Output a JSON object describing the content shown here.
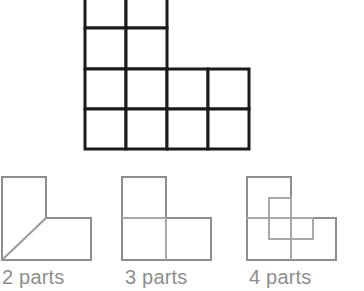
{
  "page": {
    "background_color": "#ffffff"
  },
  "main_shape": {
    "name": "l-shaped-polyomino-grid",
    "description": "Thick black outlined L-shaped polyomino made of unit squares",
    "stroke_color": "#1a1a1a",
    "stroke_width": 3,
    "cell_size": 41,
    "origin_x": 85,
    "origin_y": -12,
    "cells": [
      {
        "col": 0,
        "row": 0
      },
      {
        "col": 1,
        "row": 0
      },
      {
        "col": 0,
        "row": 1
      },
      {
        "col": 1,
        "row": 1
      },
      {
        "col": 0,
        "row": 2
      },
      {
        "col": 1,
        "row": 2
      },
      {
        "col": 2,
        "row": 2
      },
      {
        "col": 3,
        "row": 2
      },
      {
        "col": 0,
        "row": 3
      },
      {
        "col": 1,
        "row": 3
      },
      {
        "col": 2,
        "row": 3
      },
      {
        "col": 3,
        "row": 3
      }
    ],
    "cell_count": 12,
    "columns": 4,
    "rows": 4
  },
  "figures": [
    {
      "id": "fig-2-parts",
      "label": "2 parts",
      "parts": 2,
      "stroke_color": "#8d8d8d",
      "inner_stroke_color": "#9b9b9b",
      "stroke_width": 2,
      "outline_type": "L-shape",
      "cut_type": "diagonal",
      "cut_description": "single diagonal line from inner corner to bottom-left corner"
    },
    {
      "id": "fig-3-parts",
      "label": "3 parts",
      "parts": 3,
      "stroke_color": "#8d8d8d",
      "inner_stroke_color": "#a8a8a8",
      "stroke_width": 2,
      "outline_type": "L-shape",
      "cut_type": "unit-squares",
      "cut_description": "L-shape split into three equal unit squares"
    },
    {
      "id": "fig-4-parts",
      "label": "4 parts",
      "parts": 4,
      "stroke_color": "#8d8d8d",
      "inner_stroke_color": "#a8a8a8",
      "stroke_width": 2,
      "outline_type": "L-shape",
      "cut_type": "offset-L",
      "cut_description": "L-shape with unit grid plus an offset half-scale inner L outline"
    }
  ],
  "labels": {
    "two_parts": "2 parts",
    "three_parts": "3 parts",
    "four_parts": "4 parts",
    "color": "#8d8d8d"
  }
}
